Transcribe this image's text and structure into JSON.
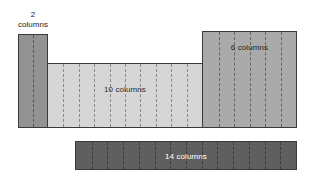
{
  "diagram": {
    "background_color": "#ffffff",
    "callout": {
      "line1": "2",
      "line2": "columns"
    },
    "blocks": [
      {
        "id": "two",
        "label": "2 columns",
        "columns": 2,
        "dividers": 1,
        "fill_color": "#929292",
        "border_color": "#3a3a3a",
        "label_color": "#1a1a1a",
        "label_position": "above-outside"
      },
      {
        "id": "ten",
        "label": "10 columns",
        "columns": 10,
        "dividers": 9,
        "fill_color": "#d6d6d6",
        "border_color": "#3a3a3a",
        "label_color": "#2b2b2b",
        "label_position": "inside-top"
      },
      {
        "id": "six",
        "label": "6 columns",
        "columns": 6,
        "dividers": 5,
        "fill_color": "#aaaaaa",
        "border_color": "#3a3a3a",
        "label_color": "#1f1f1f",
        "label_position": "inside-top"
      },
      {
        "id": "fourteen",
        "label": "14 columns",
        "columns": 14,
        "dividers": 13,
        "fill_color": "#5f5f5f",
        "border_color": "#3a3a3a",
        "label_color": "#ffffff",
        "label_position": "inside-center"
      }
    ]
  }
}
